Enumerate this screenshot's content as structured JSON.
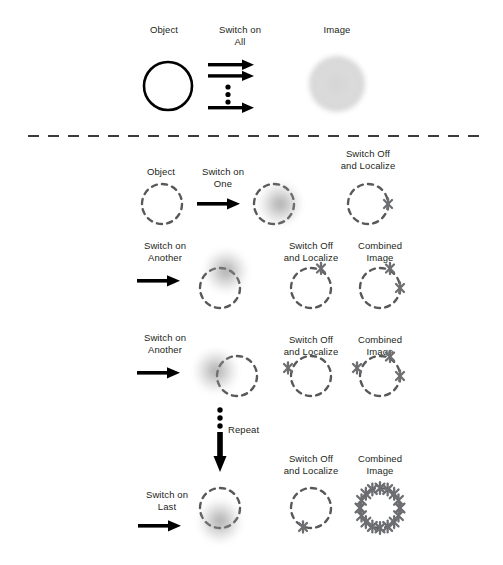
{
  "figure": {
    "title_top_row": {
      "object_label": "Object",
      "switch_label": "Switch on\nAll",
      "image_label": "Image"
    },
    "labels": {
      "object": "Object",
      "switch_on_all": "Switch on\nAll",
      "image": "Image",
      "switch_on_one": "Switch on\nOne",
      "switch_on_another": "Switch on\nAnother",
      "switch_on_last": "Switch on\nLast",
      "switch_off_and_localize": "Switch Off\nand Localize",
      "combined_image": "Combined\nImage",
      "repeat": "Repeat"
    },
    "colors": {
      "ink": "#231f20",
      "dashed_circle": "#58595b",
      "marker": "#6d6e71",
      "blob": "#8a8a8a",
      "divider": "#3b3b3b"
    },
    "rows": [
      {
        "name": "row-all",
        "step_label": "Switch on\nAll",
        "left_label": "Object",
        "right_label": "Image",
        "blob_count": 1
      },
      {
        "name": "row-one",
        "step_label": "Switch on\nOne",
        "object_label": "Object",
        "localize_label": "Switch Off\nand Localize",
        "markers": 1,
        "blob_angle_deg": 0
      },
      {
        "name": "row-another-1",
        "step_label": "Switch on\nAnother",
        "localize_label": "Switch Off\nand Localize",
        "combined_label": "Combined\nImage",
        "markers": 1,
        "combined_markers": 2,
        "blob_angle_deg": 300
      },
      {
        "name": "row-another-2",
        "step_label": "Switch on\nAnother",
        "localize_label": "Switch Off\nand Localize",
        "combined_label": "Combined\nImage",
        "markers": 1,
        "combined_markers": 3,
        "blob_angle_deg": 195
      },
      {
        "name": "row-last",
        "step_label": "Switch on\nLast",
        "localize_label": "Switch Off\nand Localize",
        "combined_label": "Combined\nImage",
        "markers": 1,
        "combined_markers": 16,
        "blob_angle_deg": 90
      }
    ],
    "chart_data": {
      "type": "diagram",
      "title": "Single-molecule switching and localization super-resolution imaging principle",
      "marker_angles_deg": {
        "row_one_localize": [
          0
        ],
        "row_another1_localize": [
          300
        ],
        "row_another1_combined": [
          300,
          0
        ],
        "row_another2_localize": [
          195
        ],
        "row_another2_combined": [
          195,
          300,
          0
        ],
        "row_last_localize": [
          90
        ],
        "row_last_combined": [
          0,
          22.5,
          45,
          67.5,
          90,
          112.5,
          135,
          157.5,
          180,
          202.5,
          225,
          247.5,
          270,
          292.5,
          315,
          337.5
        ]
      },
      "notes": "Each row switches on a sparse subset of fluorophores, localizes them as crosses, and accumulates them into the combined image until the ring is fully reconstructed."
    }
  }
}
